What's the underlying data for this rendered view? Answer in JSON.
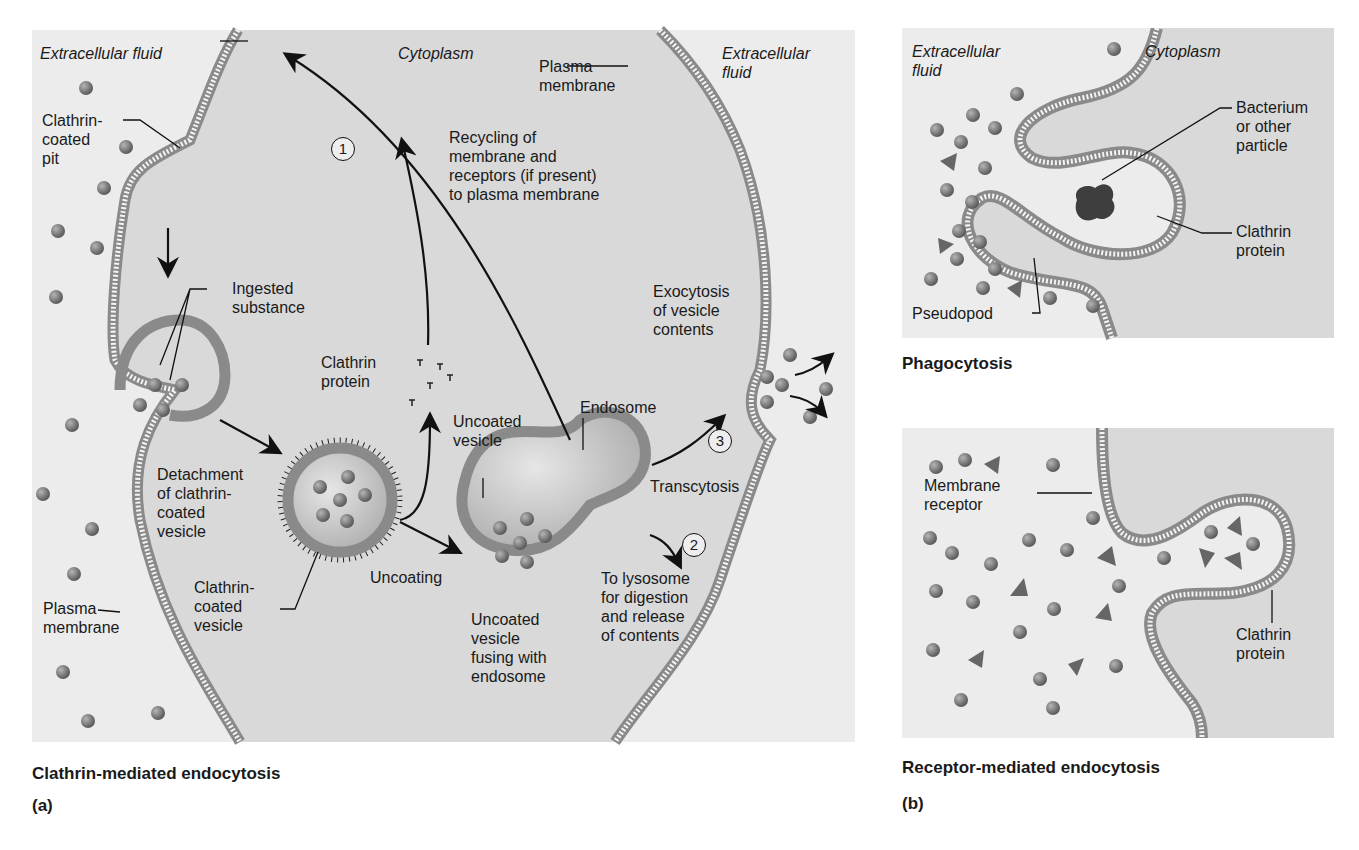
{
  "figure": {
    "panel_a": {
      "caption": "Clathrin-mediated endocytosis",
      "letter": "(a)",
      "labels": {
        "extracellular_left": "Extracellular fluid",
        "cytoplasm": "Cytoplasm",
        "extracellular_right": "Extracellular\nfluid",
        "plasma_membrane_top": "Plasma\nmembrane",
        "clathrin_coated_pit": "Clathrin-\ncoated\npit",
        "recycling": "Recycling of\nmembrane and\nreceptors (if present)\nto plasma membrane",
        "ingested_substance": "Ingested\nsubstance",
        "clathrin_protein": "Clathrin\nprotein",
        "exocytosis": "Exocytosis\nof vesicle\ncontents",
        "endosome": "Endosome",
        "uncoated_vesicle": "Uncoated\nvesicle",
        "detachment": "Detachment\nof clathrin-\ncoated\nvesicle",
        "transcytosis": "Transcytosis",
        "clathrin_coated_vesicle": "Clathrin-\ncoated\nvesicle",
        "uncoating": "Uncoating",
        "to_lysosome": "To lysosome\nfor digestion\nand release\nof contents",
        "plasma_membrane_left": "Plasma\nmembrane",
        "uncoated_fusing": "Uncoated\nvesicle\nfusing with\nendosome"
      },
      "steps": [
        "1",
        "2",
        "3"
      ]
    },
    "panel_b": {
      "letter": "(b)",
      "phagocytosis": {
        "caption": "Phagocytosis",
        "labels": {
          "extracellular": "Extracellular\nfluid",
          "cytoplasm": "Cytoplasm",
          "bacterium": "Bacterium\nor other\nparticle",
          "clathrin_protein": "Clathrin\nprotein",
          "pseudopod": "Pseudopod"
        }
      },
      "receptor_mediated": {
        "caption": "Receptor-mediated endocytosis",
        "labels": {
          "membrane_receptor": "Membrane\nreceptor",
          "clathrin_protein": "Clathrin\nprotein"
        }
      }
    },
    "colors": {
      "extracellular_bg": "#ececec",
      "cytoplasm_bg": "#d9d9d9",
      "membrane": "#8a8a8a",
      "particle": "#7a7a7a",
      "bacterium": "#3e3e3e"
    }
  }
}
